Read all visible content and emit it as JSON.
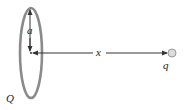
{
  "diagram": {
    "labels": {
      "radius": "a",
      "distance": "x",
      "ring_charge": "Q",
      "point_charge": "q"
    },
    "colors": {
      "ring": "#8a8a8a",
      "arrow": "#333333",
      "point_charge_fill": "#dcdcdc",
      "point_charge_stroke": "#9a9a9a",
      "text": "#222222"
    }
  }
}
